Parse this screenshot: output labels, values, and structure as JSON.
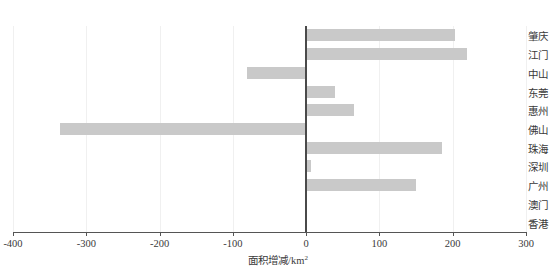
{
  "chart_data": {
    "type": "bar",
    "orientation": "horizontal",
    "title": "",
    "xlabel": "面积增减/km²",
    "ylabel": "",
    "xlim": [
      -400,
      300
    ],
    "xticks": [
      -400,
      -300,
      -200,
      -100,
      0,
      100,
      200,
      300
    ],
    "xtick_labels": [
      "-400",
      "-300",
      "-200",
      "-100",
      "0",
      "100",
      "200",
      "300"
    ],
    "grid": "vertical-light",
    "legend": "none",
    "zero_reference_line": true,
    "bar_color": "#c9c9c9",
    "axis_color": "#555555",
    "categories": [
      "肇庆",
      "江门",
      "中山",
      "东莞",
      "惠州",
      "佛山",
      "珠海",
      "深圳",
      "广州",
      "澳门",
      "香港"
    ],
    "values": [
      203,
      220,
      -81,
      39,
      65,
      -336,
      185,
      6,
      150,
      0,
      0
    ],
    "series": [
      {
        "name": "面积增减",
        "values": [
          203,
          220,
          -81,
          39,
          65,
          -336,
          185,
          6,
          150,
          0,
          0
        ]
      }
    ]
  },
  "axis": {
    "x_title_text": "面积增减/km",
    "x_title_sup": "2"
  }
}
